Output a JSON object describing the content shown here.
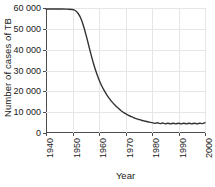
{
  "chart_data": {
    "type": "line",
    "title": "",
    "xlabel": "Year",
    "ylabel": "Number of cases of TB",
    "xlim": [
      1940,
      2000
    ],
    "ylim": [
      0,
      60000
    ],
    "grid": true,
    "legend": null,
    "line_color": "#333333",
    "grid_color": "#e6e6e6",
    "axis_color": "#4d4d4d",
    "xticks": [
      1940,
      1950,
      1960,
      1970,
      1980,
      1990,
      2000
    ],
    "xtick_labels": [
      "1940",
      "1950",
      "1960",
      "1970",
      "1980",
      "1990",
      "2000"
    ],
    "yticks": [
      0,
      10000,
      20000,
      30000,
      40000,
      50000,
      60000
    ],
    "ytick_labels": [
      "0",
      "10 000",
      "20 000",
      "30 000",
      "40 000",
      "50 000",
      "60 000"
    ],
    "series": [
      {
        "name": "Number of cases of TB",
        "x": [
          1940,
          1942,
          1944,
          1946,
          1948,
          1950,
          1951,
          1952,
          1953,
          1954,
          1955,
          1956,
          1957,
          1958,
          1959,
          1960,
          1961,
          1962,
          1963,
          1964,
          1965,
          1966,
          1967,
          1968,
          1969,
          1970,
          1971,
          1972,
          1973,
          1974,
          1975,
          1976,
          1977,
          1978,
          1979,
          1980,
          1981,
          1982,
          1983,
          1984,
          1985,
          1986,
          1987,
          1988,
          1989,
          1990,
          1991,
          1992,
          1993,
          1994,
          1995,
          1996,
          1997,
          1998,
          1999,
          2000
        ],
        "values": [
          59500,
          59500,
          59500,
          59500,
          59450,
          59300,
          58800,
          57600,
          55400,
          52000,
          47600,
          42600,
          37600,
          33000,
          29000,
          25600,
          22700,
          20300,
          18200,
          16400,
          14800,
          13400,
          12200,
          11100,
          10100,
          9300,
          8600,
          8000,
          7400,
          6900,
          6500,
          6100,
          5800,
          5500,
          5200,
          5000,
          4600,
          4900,
          4500,
          4800,
          4400,
          4700,
          4400,
          4700,
          4400,
          4700,
          4400,
          4700,
          4400,
          4700,
          4400,
          4700,
          4400,
          4700,
          4500,
          5000
        ]
      }
    ]
  }
}
